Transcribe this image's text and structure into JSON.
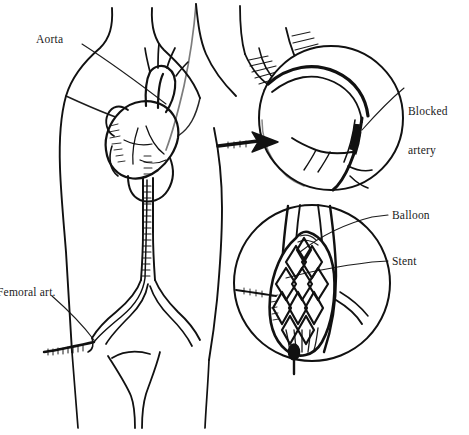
{
  "figure": {
    "background_color": "#ffffff",
    "ink_color": "#111111",
    "label_color": "#1a1a1a",
    "width": 469,
    "height": 435,
    "style": "black-and-white pen-and-ink line drawing"
  },
  "labels": {
    "aorta": "Aorta",
    "blocked_artery_line1": "Blocked",
    "blocked_artery_line2": "artery",
    "balloon": "Balloon",
    "stent": "Stent",
    "femoral_artery": "Femoral art.",
    "femoral_artery_clipped": "emoral art."
  },
  "panels": {
    "torso": {
      "name": "patient-torso",
      "description": "Frontal view of a human torso showing the heart, aorta, and catheter threaded from the femoral artery up to the heart"
    },
    "heart_inset": {
      "name": "heart-magnifier",
      "description": "Circular magnified view of the heart showing a blocked coronary artery",
      "center_x": 331,
      "center_y": 118,
      "radius": 72
    },
    "stent_inset": {
      "name": "stent-magnifier",
      "description": "Circular magnified view of the artery with an expanded balloon and diamond-mesh stent",
      "center_x": 312,
      "center_y": 283,
      "radius": 78
    }
  },
  "annotations": {
    "arrow": {
      "name": "magnify-arrow",
      "description": "Solid black arrow pointing from the torso heart into the magnified heart inset"
    }
  }
}
